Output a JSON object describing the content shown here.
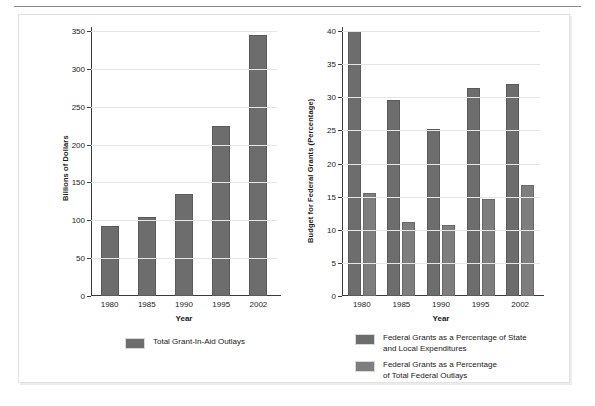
{
  "figure": {
    "background_color": "#ffffff",
    "frame_border_color": "#e2e2e2",
    "bar_color_series1": "#6d6d6d",
    "bar_color_series2": "#7e7e7e",
    "axis_color": "#3a3a3a",
    "gridline_color": "#e6e6e6"
  },
  "chart_data": [
    {
      "type": "bar",
      "title": "",
      "xlabel": "Year",
      "ylabel": "Billions of Dollars",
      "categories": [
        "1980",
        "1985",
        "1990",
        "1995",
        "2002"
      ],
      "values": [
        92,
        105,
        135,
        224,
        345
      ],
      "series": [
        {
          "name": "Total Grant-In-Aid Outlays",
          "values": [
            92,
            105,
            135,
            224,
            345
          ],
          "color": "#6d6d6d"
        }
      ],
      "ylim": [
        0,
        350
      ],
      "yticks": [
        0,
        50,
        100,
        150,
        200,
        250,
        300,
        350
      ],
      "ytick_labels": [
        "0",
        "50",
        "100",
        "150",
        "200",
        "250",
        "300",
        "350"
      ],
      "grid": true,
      "legend_position": "bottom"
    },
    {
      "type": "bar",
      "title": "",
      "xlabel": "Year",
      "ylabel": "Budget for Federal Grants (Percentage)",
      "categories": [
        "1980",
        "1985",
        "1990",
        "1995",
        "2002"
      ],
      "series": [
        {
          "name": "Federal Grants as a Percentage of State and Local Expenditures",
          "values": [
            40.0,
            29.6,
            25.2,
            31.4,
            32.0
          ],
          "color": "#6d6d6d"
        },
        {
          "name": "Federal Grants as a Percentage of Total Federal Outlays",
          "values": [
            15.5,
            11.2,
            10.7,
            14.7,
            16.8
          ],
          "color": "#7e7e7e"
        }
      ],
      "ylim": [
        0,
        40
      ],
      "yticks": [
        0,
        5,
        10,
        15,
        20,
        25,
        30,
        35,
        40
      ],
      "ytick_labels": [
        "0",
        "5",
        "10",
        "15",
        "20",
        "25",
        "30",
        "35",
        "40"
      ],
      "grid": true,
      "legend_position": "bottom"
    }
  ],
  "legends": {
    "left": [
      {
        "label": "Total Grant-In-Aid Outlays",
        "color": "#6d6d6d"
      }
    ],
    "right": [
      {
        "line1": "Federal Grants as a Percentage of State",
        "line2": "and Local Expenditures",
        "color": "#6d6d6d"
      },
      {
        "line1": "Federal Grants as a Percentage",
        "line2": "of Total Federal Outlays",
        "color": "#7e7e7e"
      }
    ]
  }
}
